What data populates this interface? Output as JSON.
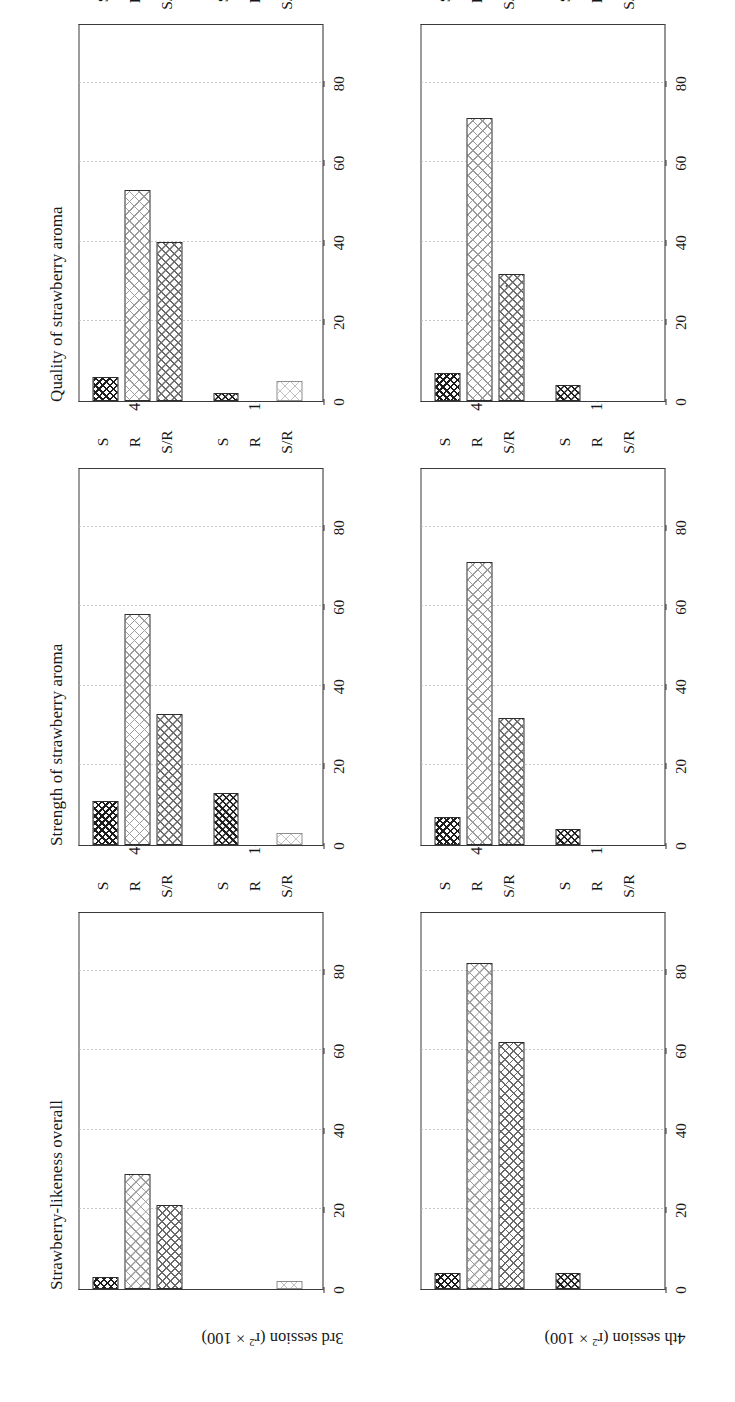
{
  "figure": {
    "panel_titles": [
      "Strawberry-likeness overall",
      "Strength of strawberry aroma",
      "Quality of strawberry aroma"
    ],
    "row_labels": [
      "3rd session (r",
      "4th session (r"
    ],
    "row_label_sup": "2",
    "row_label_tail": " × 100)",
    "y_ticks": [
      "0",
      "20",
      "40",
      "60",
      "80"
    ],
    "x_ticks": [
      "S",
      "R",
      "S/R"
    ],
    "x_groups": [
      "4-d",
      "1-d"
    ]
  },
  "chart_data": {
    "type": "bar",
    "title": "",
    "xlabel": "",
    "ylabel": "r² × 100",
    "ylim": [
      0,
      95
    ],
    "y_ticks": [
      0,
      20,
      40,
      60,
      80
    ],
    "grid": true,
    "legend_position": "none",
    "categories": [
      "4-d S",
      "4-d R",
      "4-d S/R",
      "1-d S",
      "1-d R",
      "1-d S/R"
    ],
    "panels": [
      {
        "title": "Strawberry-likeness overall",
        "row": "3rd session (r² × 100)",
        "values": [
          3,
          29,
          21,
          0,
          0,
          2
        ]
      },
      {
        "title": "Strength of strawberry aroma",
        "row": "3rd session (r² × 100)",
        "values": [
          11,
          58,
          33,
          13,
          0,
          3
        ]
      },
      {
        "title": "Quality of strawberry aroma",
        "row": "3rd session (r² × 100)",
        "values": [
          6,
          53,
          40,
          2,
          0,
          5
        ]
      },
      {
        "title": "Strawberry-likeness overall",
        "row": "4th session (r² × 100)",
        "values": [
          4,
          82,
          62,
          4,
          0,
          0
        ]
      },
      {
        "title": "Strength of strawberry aroma",
        "row": "4th session (r² × 100)",
        "values": [
          7,
          71,
          32,
          4,
          0,
          0
        ]
      },
      {
        "title": "Quality of strawberry aroma",
        "row": "4th session (r² × 100)",
        "values": [
          7,
          71,
          32,
          4,
          0,
          0
        ]
      }
    ]
  }
}
